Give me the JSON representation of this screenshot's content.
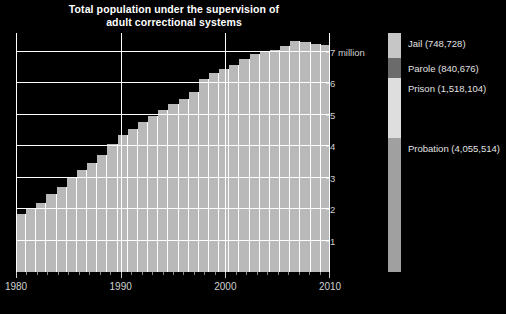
{
  "chart_data": {
    "type": "area",
    "title": "Total population under the supervision of adult correctional systems",
    "title_lines": [
      "Total population under the supervision of",
      "adult correctional systems"
    ],
    "xlabel": "",
    "ylabel": "",
    "ylim": [
      0,
      7.6
    ],
    "xlim": [
      1980,
      2010
    ],
    "grid": true,
    "y_unit": "million",
    "y_ticks": [
      1,
      2,
      3,
      4,
      5,
      6,
      7
    ],
    "y_tick_labels": [
      "1",
      "2",
      "3",
      "4",
      "5",
      "6",
      "7 million"
    ],
    "x_ticks": [
      1980,
      1990,
      2000,
      2010
    ],
    "x_tick_labels": [
      "1980",
      "1990",
      "2000",
      "2010"
    ],
    "legend_position": "right",
    "legend_year_label": "2010",
    "categories": [
      1980,
      1981,
      1982,
      1983,
      1984,
      1985,
      1986,
      1987,
      1988,
      1989,
      1990,
      1991,
      1992,
      1993,
      1994,
      1995,
      1996,
      1997,
      1998,
      1999,
      2000,
      2001,
      2002,
      2003,
      2004,
      2005,
      2006,
      2007,
      2008,
      2009,
      2010
    ],
    "values": [
      1.84,
      2.01,
      2.19,
      2.48,
      2.69,
      3.01,
      3.24,
      3.46,
      3.71,
      4.06,
      4.35,
      4.54,
      4.76,
      4.95,
      5.14,
      5.34,
      5.49,
      5.73,
      6.13,
      6.34,
      6.47,
      6.59,
      6.76,
      6.93,
      6.99,
      7.06,
      7.2,
      7.34,
      7.31,
      7.24,
      7.21
    ],
    "series": [
      {
        "name": "Probation",
        "total_2010": 4055514,
        "color": "#9e9e9e"
      },
      {
        "name": "Prison",
        "total_2010": 1518104,
        "color": "#dcdcdc"
      },
      {
        "name": "Parole",
        "total_2010": 840676,
        "color": "#6a6a6a"
      },
      {
        "name": "Jail",
        "total_2010": 748728,
        "color": "#c4c4c4"
      }
    ],
    "legend_entries": [
      {
        "label": "Jail (748,728)",
        "color": "#c6c6c6",
        "top_pct": 0.0,
        "height_pct": 10.5
      },
      {
        "label": "Parole (840,676)",
        "color": "#6b6b6b",
        "top_pct": 10.5,
        "height_pct": 8.4
      },
      {
        "label": "Prison (1,518,104)",
        "color": "#dedede",
        "top_pct": 18.9,
        "height_pct": 25.1
      },
      {
        "label": "Probation (4,055,514)",
        "color": "#a0a0a0",
        "top_pct": 44.0,
        "height_pct": 56.0
      }
    ],
    "area_color": "#b9b9b9",
    "grid_color": "#ffffff",
    "background_color": "#000000"
  }
}
